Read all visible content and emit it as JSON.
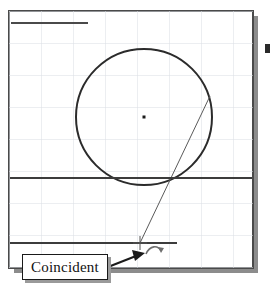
{
  "app": {
    "kind": "cad-sketch-viewport",
    "background_color": "#ffffff"
  },
  "canvas": {
    "name": "sketch-drawing-area",
    "x": 9,
    "y": 11,
    "width": 244,
    "height": 257,
    "border_color": "#4a4a4a",
    "fill_color": "#ffffff",
    "shadow_color": "#8c8c8c",
    "shadow_offset": 5
  },
  "grid": {
    "visible": true,
    "spacing": 32,
    "color": "#d9dde3",
    "line_width": 1
  },
  "geometry": {
    "circle": {
      "name": "sketch-circle",
      "center_x": 144,
      "center_y": 117,
      "radius": 68,
      "stroke_color": "#2b2b2b",
      "stroke_width": 2
    },
    "center_point": {
      "name": "circle-center-point",
      "x": 144,
      "y": 117,
      "color": "#1a1a1a",
      "size": 3
    },
    "lines": [
      {
        "name": "top-horizontal-line",
        "x1": 11,
        "y1": 23,
        "x2": 88,
        "y2": 23,
        "stroke_color": "#4a4a4a",
        "stroke_width": 2
      },
      {
        "name": "middle-horizontal-line",
        "x1": 10,
        "y1": 178,
        "x2": 252,
        "y2": 178,
        "stroke_color": "#3c3c3c",
        "stroke_width": 2
      },
      {
        "name": "bottom-horizontal-line",
        "x1": 10,
        "y1": 243,
        "x2": 177,
        "y2": 243,
        "stroke_color": "#3c3c3c",
        "stroke_width": 2
      },
      {
        "name": "diagonal-construction-line",
        "x1": 210,
        "y1": 96,
        "x2": 140,
        "y2": 243,
        "stroke_color": "#5a5a5a",
        "stroke_width": 1
      }
    ]
  },
  "cursor": {
    "name": "snap-crosshair",
    "x": 140,
    "y": 243,
    "arm_length": 7,
    "color": "#555555"
  },
  "pointer": {
    "name": "mouse-pointer-arrow",
    "tip_x": 145,
    "tip_y": 253,
    "tail_x": 108,
    "tail_y": 267,
    "color": "#1a1a1a",
    "relation_glyph": "coincident-relation-icon"
  },
  "callout": {
    "name": "coincident-tooltip",
    "label": "Coincident",
    "background_color": "#ffffff",
    "border_color": "#1a1a1a",
    "text_color": "#111111",
    "shadow_color": "#9a9a9a"
  },
  "margin_mark": {
    "name": "page-edge-mark",
    "x": 266,
    "y": 48,
    "color": "#2a2a2a"
  }
}
